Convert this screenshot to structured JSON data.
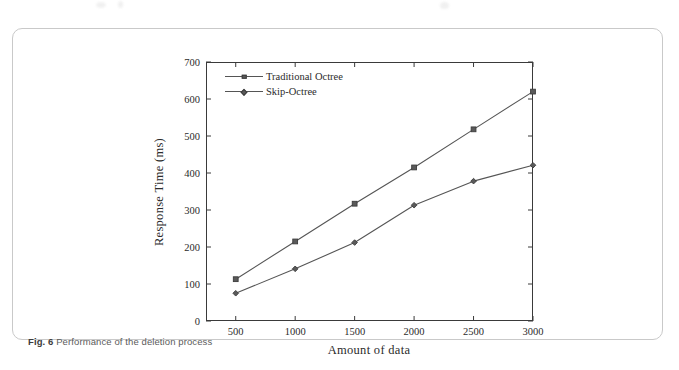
{
  "figure": {
    "caption_number": "Fig. 6",
    "caption_text": "Performance of the deletion process"
  },
  "colors": {
    "line": "#555555",
    "marker_fill": "#5a5a5a",
    "marker_stroke": "#3c3c3c",
    "axis": "#3a3a3a",
    "text": "#2b2b2b",
    "caption": "#5b5b5b",
    "card_border": "#c9c9c9",
    "background": "#ffffff"
  },
  "chart_data": {
    "type": "line",
    "title": "",
    "xlabel": "Amount of data",
    "ylabel": "Response Time (ms)",
    "x": [
      500,
      1000,
      1500,
      2000,
      2500,
      3000
    ],
    "xticks": [
      "500",
      "1000",
      "1500",
      "2000",
      "2500",
      "3000"
    ],
    "yticks": [
      "0",
      "100",
      "200",
      "300",
      "400",
      "500",
      "600",
      "700"
    ],
    "ytick_values": [
      0,
      100,
      200,
      300,
      400,
      500,
      600,
      700
    ],
    "xlim": [
      250,
      3000
    ],
    "ylim": [
      0,
      700
    ],
    "grid": false,
    "legend_position": "top-left",
    "series": [
      {
        "name": "Traditional Octree",
        "marker": "square",
        "values": [
          113,
          215,
          317,
          415,
          518,
          620
        ]
      },
      {
        "name": "Skip-Octree",
        "marker": "diamond",
        "values": [
          75,
          141,
          212,
          313,
          378,
          421
        ]
      }
    ]
  }
}
